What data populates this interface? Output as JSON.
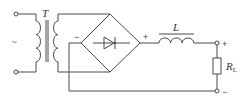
{
  "diagram": {
    "type": "circuit",
    "labels": {
      "ac_source": "~",
      "transformer": "T",
      "bridge_negative": "−",
      "bridge_positive": "+",
      "inductor": "L",
      "load_resistor_main": "R",
      "load_resistor_sub": "L",
      "output_positive": "+",
      "output_negative": "−"
    },
    "components": [
      {
        "id": "ac-input",
        "kind": "ac-source-terminals"
      },
      {
        "id": "T",
        "kind": "transformer"
      },
      {
        "id": "bridge",
        "kind": "bridge-rectifier"
      },
      {
        "id": "L",
        "kind": "inductor"
      },
      {
        "id": "RL",
        "kind": "resistor"
      }
    ],
    "colors": {
      "line": "#4a4a4a",
      "background": "#ffffff"
    }
  }
}
